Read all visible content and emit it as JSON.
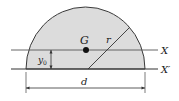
{
  "diagram": {
    "shape": "semicircle",
    "fill_color": "#dcdcdc",
    "stroke_color": "#333333",
    "labels": {
      "centroid": "G",
      "radius": "r",
      "axis_through_centroid": "X",
      "base_axis": "X′",
      "centroid_distance": "y",
      "centroid_distance_sub": "0",
      "diameter": "d"
    }
  }
}
